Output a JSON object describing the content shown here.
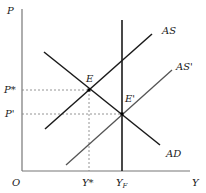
{
  "diagram": {
    "type": "AS-AD model",
    "axes": {
      "y_label": "P",
      "x_label": "Y",
      "origin_label": "O"
    },
    "curves": [
      {
        "id": "AS",
        "label": "AS",
        "color": "#1a1a1a"
      },
      {
        "id": "AS_prime",
        "label": "AS'",
        "color": "#555555"
      },
      {
        "id": "AD",
        "label": "AD",
        "color": "#1a1a1a"
      },
      {
        "id": "YF",
        "label": "Y",
        "subscript": "F",
        "color": "#1a1a1a"
      }
    ],
    "points": [
      {
        "id": "E",
        "label": "E"
      },
      {
        "id": "E_prime",
        "label": "E'"
      }
    ],
    "price_levels": [
      {
        "label": "P*"
      },
      {
        "label": "P'"
      }
    ],
    "output_levels": [
      {
        "label": "Y*"
      },
      {
        "label": "Y",
        "subscript": "F"
      }
    ]
  }
}
